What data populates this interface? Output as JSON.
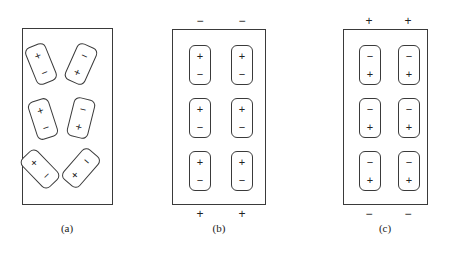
{
  "figure": {
    "background_color": "#ffffff",
    "line_color": "#3a3a3a",
    "symbol_color": "#222222",
    "glyphs": {
      "plus": "+",
      "minus": "−"
    }
  },
  "panels": [
    {
      "id": "a",
      "caption": "(a)",
      "box": {
        "x": 22,
        "y": 28,
        "w": 91,
        "h": 177
      },
      "arrangement": "random",
      "terminals_top": [],
      "terminals_bottom": [],
      "domains": [
        {
          "name": "domain-a-1",
          "x": 8,
          "y": 16,
          "rotation": -22,
          "top": "+",
          "bottom": "−"
        },
        {
          "name": "domain-a-2",
          "x": 48,
          "y": 16,
          "rotation": 24,
          "top": "−",
          "bottom": "+"
        },
        {
          "name": "domain-a-3",
          "x": 10,
          "y": 71,
          "rotation": -18,
          "top": "+",
          "bottom": "−"
        },
        {
          "name": "domain-a-4",
          "x": 48,
          "y": 70,
          "rotation": 14,
          "top": "−",
          "bottom": "+"
        },
        {
          "name": "domain-a-5",
          "x": 7,
          "y": 121,
          "rotation": -44,
          "top": "+",
          "bottom": "−"
        },
        {
          "name": "domain-a-6",
          "x": 48,
          "y": 120,
          "rotation": 41,
          "top": "−",
          "bottom": "+"
        }
      ]
    },
    {
      "id": "b",
      "caption": "(b)",
      "box": {
        "x": 172,
        "y": 29,
        "w": 94,
        "h": 176
      },
      "arrangement": "aligned",
      "terminals_top": [
        {
          "name": "terminal-b-top-left",
          "label": "−",
          "x": 193,
          "y": 15
        },
        {
          "name": "terminal-b-top-right",
          "label": "−",
          "x": 235,
          "y": 15
        }
      ],
      "terminals_bottom": [
        {
          "name": "terminal-b-bottom-left",
          "label": "+",
          "x": 193,
          "y": 208
        },
        {
          "name": "terminal-b-bottom-right",
          "label": "+",
          "x": 235,
          "y": 208
        }
      ],
      "domains": [
        {
          "name": "domain-b-1",
          "x": 17,
          "y": 16,
          "rotation": 0,
          "top": "+",
          "bottom": "−"
        },
        {
          "name": "domain-b-2",
          "x": 59,
          "y": 16,
          "rotation": 0,
          "top": "+",
          "bottom": "−"
        },
        {
          "name": "domain-b-3",
          "x": 17,
          "y": 69,
          "rotation": 0,
          "top": "+",
          "bottom": "−"
        },
        {
          "name": "domain-b-4",
          "x": 59,
          "y": 69,
          "rotation": 0,
          "top": "+",
          "bottom": "−"
        },
        {
          "name": "domain-b-5",
          "x": 17,
          "y": 122,
          "rotation": 0,
          "top": "+",
          "bottom": "−"
        },
        {
          "name": "domain-b-6",
          "x": 59,
          "y": 122,
          "rotation": 0,
          "top": "+",
          "bottom": "−"
        }
      ]
    },
    {
      "id": "c",
      "caption": "(c)",
      "box": {
        "x": 343,
        "y": 29,
        "w": 85,
        "h": 176
      },
      "arrangement": "aligned-reversed",
      "terminals_top": [
        {
          "name": "terminal-c-top-left",
          "label": "+",
          "x": 362,
          "y": 15
        },
        {
          "name": "terminal-c-top-right",
          "label": "+",
          "x": 401,
          "y": 15
        }
      ],
      "terminals_bottom": [
        {
          "name": "terminal-c-bottom-left",
          "label": "−",
          "x": 362,
          "y": 208
        },
        {
          "name": "terminal-c-bottom-right",
          "label": "−",
          "x": 401,
          "y": 208
        }
      ],
      "domains": [
        {
          "name": "domain-c-1",
          "x": 16,
          "y": 16,
          "rotation": 0,
          "top": "−",
          "bottom": "+"
        },
        {
          "name": "domain-c-2",
          "x": 55,
          "y": 16,
          "rotation": 0,
          "top": "−",
          "bottom": "+"
        },
        {
          "name": "domain-c-3",
          "x": 16,
          "y": 69,
          "rotation": 0,
          "top": "−",
          "bottom": "+"
        },
        {
          "name": "domain-c-4",
          "x": 55,
          "y": 69,
          "rotation": 0,
          "top": "−",
          "bottom": "+"
        },
        {
          "name": "domain-c-5",
          "x": 16,
          "y": 122,
          "rotation": 0,
          "top": "−",
          "bottom": "+"
        },
        {
          "name": "domain-c-6",
          "x": 55,
          "y": 122,
          "rotation": 0,
          "top": "−",
          "bottom": "+"
        }
      ]
    }
  ]
}
